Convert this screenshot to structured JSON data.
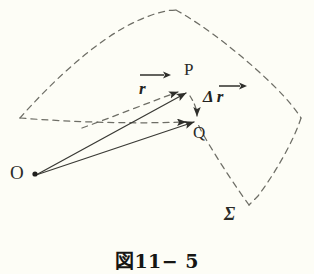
{
  "figure": {
    "caption": "図11− 5",
    "background_color": "#fdfdf6",
    "ink_color": "#3a3a35",
    "dashed_color": "#6e6e66"
  },
  "labels": {
    "origin": "O",
    "point_p": "P",
    "point_q": "Q",
    "surface": "Σ",
    "vector_r": "r",
    "vector_delta_r": "Δ",
    "vector_delta_r_symbol": "r"
  },
  "diagram": {
    "description_items": [
      "dashed curved surface boundary",
      "solid position vector from O to P",
      "solid position vector from O to Q",
      "dashed displacement segment from P to Q"
    ]
  }
}
